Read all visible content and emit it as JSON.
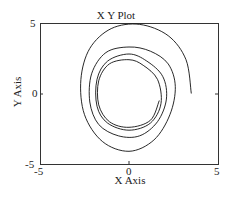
{
  "chart_data": {
    "type": "line",
    "title": "X Y Plot",
    "xlabel": "X Axis",
    "ylabel": "Y Axis",
    "xlim": [
      -5,
      5
    ],
    "ylim": [
      -5,
      5
    ],
    "xticks": [
      "-5",
      "0",
      "5"
    ],
    "yticks": [
      "-5",
      "0",
      "5"
    ],
    "grid": false,
    "legend": null,
    "series": [
      {
        "name": "spiral trajectory (limit cycle)",
        "description": "Trajectory starting at about (3.5, 0) spiraling inward toward a closed orbit of radius ~2",
        "x": [
          3.5,
          3.2,
          2.2,
          0.6,
          -1.0,
          -2.2,
          -2.7,
          -2.5,
          -1.5,
          0.0,
          1.4,
          2.3,
          2.6,
          2.2,
          1.2,
          0.0,
          -1.3,
          -2.1,
          -2.2,
          -1.7,
          -0.6,
          0.6,
          1.6,
          2.1,
          1.9,
          1.0,
          0.0,
          -1.2,
          -1.8,
          -1.8,
          -1.2,
          0.0,
          1.2,
          1.8,
          1.6,
          0.8,
          0.0,
          -1.1,
          -1.7,
          -1.7,
          -1.1,
          0.0,
          1.2,
          1.7
        ],
        "y": [
          0.0,
          2.4,
          4.1,
          4.9,
          4.6,
          3.2,
          1.0,
          -1.5,
          -3.4,
          -4.1,
          -3.3,
          -1.5,
          0.5,
          2.1,
          3.0,
          3.3,
          2.9,
          1.4,
          -0.6,
          -2.2,
          -3.0,
          -3.0,
          -2.0,
          -0.4,
          1.2,
          2.3,
          2.8,
          2.3,
          1.0,
          -0.9,
          -2.1,
          -2.6,
          -2.1,
          -0.7,
          1.0,
          2.0,
          2.4,
          2.1,
          0.9,
          -0.8,
          -2.0,
          -2.4,
          -1.9,
          -0.5
        ]
      }
    ]
  }
}
